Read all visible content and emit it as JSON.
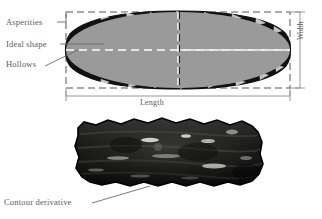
{
  "figure": {
    "panels": [
      {
        "id": "top-panel",
        "kind": "schematic-diagram",
        "description": "Gray idealized ellipse with rough dark outline, dashed bounding box and dashed center axes"
      },
      {
        "id": "bottom-panel",
        "kind": "photograph",
        "description": "Dark elongated grain photograph with rough contour"
      }
    ]
  },
  "annotations": {
    "asperities": "Asperities",
    "ideal_shape": "Ideal shape",
    "hollows": "Hollows",
    "contour_derivative": "Contour derivative"
  },
  "dimensions": {
    "length": "Length",
    "width": "Width"
  },
  "colors": {
    "ideal_fill": "#9a9a9a",
    "asperity_outline": "#111111",
    "dashed_box": "#555555",
    "dimension_line": "#8c8c8c",
    "label_text": "#5a5a5a",
    "photo_dark": "#121212",
    "background": "#ffffff"
  },
  "icons": {
    "leader_line": "leader-line-icon",
    "dimension_arrow": "dimension-arrow-icon"
  }
}
